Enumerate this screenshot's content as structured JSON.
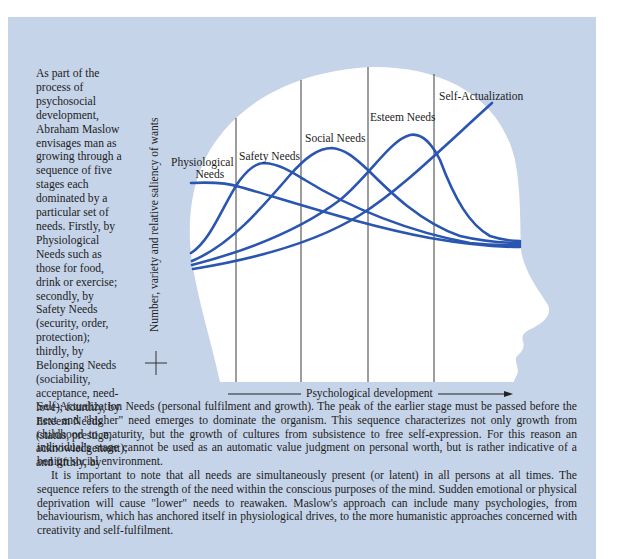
{
  "colors": {
    "panel_background": "#c6d4e9",
    "head_fill": "#ffffff",
    "curve": "#2a55b0",
    "divider": "#444444",
    "text": "#1c1c1c"
  },
  "side_text": "As part of the process of psychosocial development, Abraham Maslow envisages man as growing through a sequence of five stages each dominated by a particular set of needs. Firstly, by Physiological Needs such as those for food, drink or exercise; secondly, by Safety Needs (security, order, protection); thirdly, by Belonging Needs (sociability, acceptance, need-love); fourthly, by Esteem Needs (status, prestige, acknowledgement); and fifthly, by",
  "side_text_lines": [
    "As part of the",
    "process of",
    "psychosocial",
    "development,",
    "Abraham Maslow",
    "envisages man as",
    "growing through a",
    "sequence of five",
    "stages each",
    "dominated by a",
    "particular set of",
    "needs. Firstly, by",
    "Physiological",
    "Needs such as",
    "those for food,",
    "drink or exercise;",
    "secondly, by",
    "Safety Needs",
    "(security, order,",
    "protection);",
    "thirdly, by",
    "Belonging Needs",
    "(sociability,",
    "acceptance, need-",
    "love); fourthly, by",
    "Esteem Needs",
    "(status, prestige,",
    "acknowledgement);",
    "and fifthly, by"
  ],
  "body": {
    "paragraph1": "Self-Actualization Needs (personal fulfilment and growth). The peak of the earlier stage must be passed before the next and \"higher\" need emerges to dominate the organism. This sequence characterizes not only growth from childhood to maturity, but the growth of cultures from subsistence to free self-expression. For this reason an individual's stage cannot be used as an automatic value judgment on personal worth, but is rather indicative of a benign social environment.",
    "paragraph2": "It is important to note that all needs are simultaneously present (or latent) in all persons at all times. The sequence refers to the strength of the need within the conscious purposes of the mind. Sudden emotional or physical deprivation will cause \"lower\" needs to reawaken. Maslow's approach can include many psychologies, from behaviourism, which has anchored itself in physiological drives, to the more humanistic approaches concerned with creativity and self-fulfilment."
  },
  "diagram": {
    "y_axis_label": "Number, variety and relative saliency of wants",
    "x_axis_label": "Psychological development",
    "curve_labels": {
      "physiological_line1": "Physiological",
      "physiological_line2": "Needs",
      "safety": "Safety Needs",
      "social": "Social Needs",
      "esteem": "Esteem Needs",
      "self_actualization": "Self-Actualization"
    },
    "icons": {
      "head": "head-profile-silhouette",
      "crosshair": "plus-cross",
      "arrow": "right-arrow"
    }
  }
}
